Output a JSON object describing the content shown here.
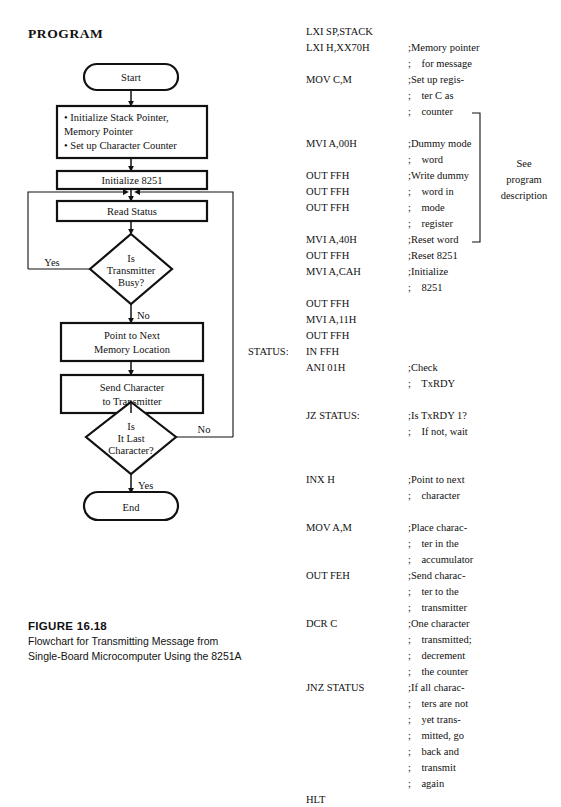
{
  "page": {
    "heading": "PROGRAM"
  },
  "flowchart": {
    "nodes": [
      {
        "id": "start",
        "shape": "terminator",
        "lines": [
          "Start"
        ]
      },
      {
        "id": "init",
        "shape": "process",
        "lines": [
          "• Initialize Stack Pointer,",
          "   Memory Pointer",
          "• Set up Character Counter"
        ]
      },
      {
        "id": "init8251",
        "shape": "process",
        "lines": [
          "Initialize 8251"
        ]
      },
      {
        "id": "readst",
        "shape": "process",
        "lines": [
          "Read Status"
        ]
      },
      {
        "id": "txbusy",
        "shape": "decision",
        "lines": [
          "Is",
          "Transmitter",
          "Busy?"
        ]
      },
      {
        "id": "pointnext",
        "shape": "process",
        "lines": [
          "Point to Next",
          "Memory Location"
        ]
      },
      {
        "id": "sendchar",
        "shape": "process",
        "lines": [
          "Send Character",
          "to Transmitter"
        ]
      },
      {
        "id": "lastchar",
        "shape": "decision",
        "lines": [
          "Is",
          "It Last",
          "Character?"
        ]
      },
      {
        "id": "end",
        "shape": "terminator",
        "lines": [
          "End"
        ]
      }
    ],
    "edge_labels": {
      "busy_yes": "Yes",
      "busy_no": "No",
      "last_no": "No",
      "last_yes": "Yes"
    }
  },
  "listing": {
    "status_label": "STATUS:",
    "lines": [
      {
        "label": "",
        "mnemonic": "LXI SP,STACK",
        "comment": ""
      },
      {
        "label": "",
        "mnemonic": "LXI H,XX70H",
        "comment": ";Memory pointer"
      },
      {
        "label": "",
        "mnemonic": "",
        "comment": ";    for message"
      },
      {
        "label": "",
        "mnemonic": "MOV C,M",
        "comment": ";Set up regis-"
      },
      {
        "label": "",
        "mnemonic": "",
        "comment": ";    ter C as"
      },
      {
        "label": "",
        "mnemonic": "",
        "comment": ";    counter"
      },
      {
        "label": "",
        "mnemonic": "",
        "comment": ""
      },
      {
        "label": "",
        "mnemonic": "MVI A,00H",
        "comment": ";Dummy mode"
      },
      {
        "label": "",
        "mnemonic": "",
        "comment": ";    word"
      },
      {
        "label": "",
        "mnemonic": "OUT FFH",
        "comment": ";Write dummy"
      },
      {
        "label": "",
        "mnemonic": "OUT FFH",
        "comment": ";    word in"
      },
      {
        "label": "",
        "mnemonic": "OUT FFH",
        "comment": ";    mode"
      },
      {
        "label": "",
        "mnemonic": "",
        "comment": ";    register"
      },
      {
        "label": "",
        "mnemonic": "MVI A,40H",
        "comment": ";Reset word"
      },
      {
        "label": "",
        "mnemonic": "OUT FFH",
        "comment": ";Reset 8251"
      },
      {
        "label": "",
        "mnemonic": "MVI A,CAH",
        "comment": ";Initialize"
      },
      {
        "label": "",
        "mnemonic": "",
        "comment": ";    8251"
      },
      {
        "label": "",
        "mnemonic": "OUT FFH",
        "comment": ""
      },
      {
        "label": "",
        "mnemonic": "MVI A,11H",
        "comment": ""
      },
      {
        "label": "",
        "mnemonic": "OUT FFH",
        "comment": ""
      },
      {
        "label": "STATUS:",
        "mnemonic": "IN FFH",
        "comment": ""
      },
      {
        "label": "",
        "mnemonic": "ANI 01H",
        "comment": ";Check"
      },
      {
        "label": "",
        "mnemonic": "",
        "comment": ";    TxRDY"
      },
      {
        "label": "",
        "mnemonic": "",
        "comment": ""
      },
      {
        "label": "",
        "mnemonic": "JZ STATUS:",
        "comment": ";Is TxRDY 1?"
      },
      {
        "label": "",
        "mnemonic": "",
        "comment": ";    If not, wait"
      },
      {
        "label": "",
        "mnemonic": "",
        "comment": ""
      },
      {
        "label": "",
        "mnemonic": "",
        "comment": ""
      },
      {
        "label": "",
        "mnemonic": "INX H",
        "comment": ";Point to next"
      },
      {
        "label": "",
        "mnemonic": "",
        "comment": ";    character"
      },
      {
        "label": "",
        "mnemonic": "",
        "comment": ""
      },
      {
        "label": "",
        "mnemonic": "MOV A,M",
        "comment": ";Place charac-"
      },
      {
        "label": "",
        "mnemonic": "",
        "comment": ";    ter in the"
      },
      {
        "label": "",
        "mnemonic": "",
        "comment": ";    accumulator"
      },
      {
        "label": "",
        "mnemonic": "OUT FEH",
        "comment": ";Send charac-"
      },
      {
        "label": "",
        "mnemonic": "",
        "comment": ";    ter to the"
      },
      {
        "label": "",
        "mnemonic": "",
        "comment": ";    transmitter"
      },
      {
        "label": "",
        "mnemonic": "DCR C",
        "comment": ";One character"
      },
      {
        "label": "",
        "mnemonic": "",
        "comment": ";    transmitted;"
      },
      {
        "label": "",
        "mnemonic": "",
        "comment": ";    decrement"
      },
      {
        "label": "",
        "mnemonic": "",
        "comment": ";    the counter"
      },
      {
        "label": "",
        "mnemonic": "JNZ STATUS",
        "comment": ";If all charac-"
      },
      {
        "label": "",
        "mnemonic": "",
        "comment": ";    ters are not"
      },
      {
        "label": "",
        "mnemonic": "",
        "comment": ";    yet trans-"
      },
      {
        "label": "",
        "mnemonic": "",
        "comment": ";    mitted, go"
      },
      {
        "label": "",
        "mnemonic": "",
        "comment": ";    back and"
      },
      {
        "label": "",
        "mnemonic": "",
        "comment": ";    transmit"
      },
      {
        "label": "",
        "mnemonic": "",
        "comment": ";    again"
      },
      {
        "label": "",
        "mnemonic": "HLT",
        "comment": ""
      }
    ],
    "side_note": [
      "See",
      "program",
      "description"
    ]
  },
  "figure": {
    "number": "FIGURE 16.18",
    "caption_line1": "Flowchart for Transmitting Message from",
    "caption_line2": "Single-Board Microcomputer Using the 8251A"
  },
  "colors": {
    "ink": "#111111",
    "paper": "#ffffff",
    "thin_rule": "#555555"
  }
}
